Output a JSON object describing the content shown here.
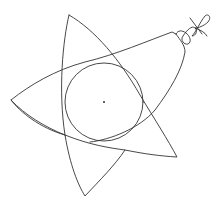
{
  "figure": {
    "stroke_color": "#333333",
    "background": "#ffffff",
    "circle": {
      "cx": 104,
      "cy": 102,
      "r": 39
    },
    "center_dot": {
      "cx": 104,
      "cy": 102
    }
  }
}
